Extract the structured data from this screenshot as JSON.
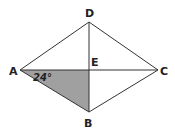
{
  "diagram": {
    "type": "rhombus-with-diagonals",
    "points": {
      "A": {
        "label": "A",
        "x": 20,
        "y": 70
      },
      "B": {
        "label": "B",
        "x": 89,
        "y": 112
      },
      "C": {
        "label": "C",
        "x": 158,
        "y": 70
      },
      "D": {
        "label": "D",
        "x": 89,
        "y": 22
      },
      "E": {
        "label": "E",
        "x": 89,
        "y": 70
      }
    },
    "shaded_region": [
      "A",
      "E",
      "B"
    ],
    "shade_color": "#a0a0a0",
    "line_color": "#333333",
    "angle_label": "24°",
    "angle_at": "A"
  }
}
